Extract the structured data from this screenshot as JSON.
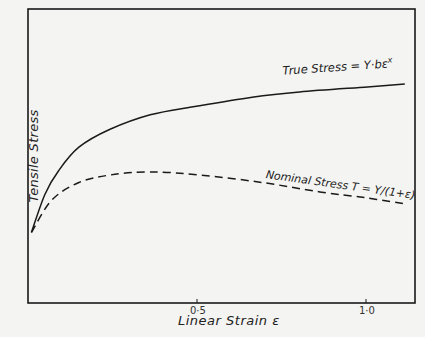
{
  "chart_data": {
    "type": "line",
    "title": "",
    "xlabel": "Linear Strain ε",
    "ylabel": "Tensile Stress",
    "xlim": [
      0,
      1.14
    ],
    "ylim": [
      0,
      100
    ],
    "x_ticks": [
      0.5,
      1.0
    ],
    "x_tick_labels": [
      "0·5",
      "1·0"
    ],
    "y_ticks": [],
    "grid": false,
    "legend": "inline annotations",
    "series": [
      {
        "name": "True Stress = Y·bε^x",
        "style": "solid",
        "x": [
          0.01,
          0.05,
          0.09,
          0.15,
          0.24,
          0.36,
          0.5,
          0.66,
          0.8,
          1.0,
          1.11
        ],
        "y": [
          24,
          37,
          45,
          53,
          59,
          64,
          67,
          70,
          71.8,
          73.5,
          74.5
        ]
      },
      {
        "name": "Nominal Stress T = Y/(1+ε)",
        "style": "dashed",
        "x": [
          0.01,
          0.07,
          0.15,
          0.24,
          0.36,
          0.51,
          0.69,
          0.86,
          1.0,
          1.11
        ],
        "y": [
          24,
          35,
          41,
          43.5,
          44.6,
          43.5,
          41,
          37.8,
          35.7,
          33.7
        ]
      }
    ],
    "annotations": [
      {
        "text": "True Stress = Y·bε^x",
        "near_series": 0
      },
      {
        "text": "Nominal Stress T = Y/(1+ε)",
        "near_series": 1
      }
    ]
  },
  "labels": {
    "ylabel": "Tensile Stress",
    "xlabel": "Linear Strain ε",
    "tick_05": "0·5",
    "tick_10": "1·0",
    "true_stress": "True Stress = Y·bε",
    "true_stress_exp": "x",
    "nominal_stress": "Nominal Stress  T = Y/(1+ε)"
  }
}
